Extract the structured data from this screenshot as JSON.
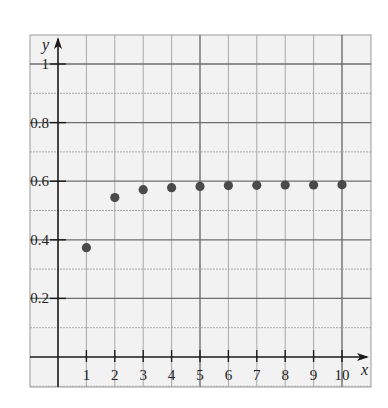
{
  "chart_data": {
    "type": "scatter",
    "title": "",
    "xlabel": "x",
    "ylabel": "y",
    "x": [
      1,
      2,
      3,
      4,
      5,
      6,
      7,
      8,
      9,
      10
    ],
    "series": [
      {
        "name": "sequence",
        "values": [
          0.373,
          0.544,
          0.571,
          0.578,
          0.582,
          0.585,
          0.586,
          0.587,
          0.587,
          0.588
        ]
      }
    ],
    "xlim": [
      -1,
      11
    ],
    "ylim": [
      -0.1,
      1.1
    ],
    "x_ticks": [
      "1",
      "2",
      "3",
      "4",
      "5",
      "6",
      "7",
      "8",
      "9",
      "10"
    ],
    "y_ticks": [
      "0.2",
      "0.4",
      "0.6",
      "0.8",
      "1"
    ],
    "grid": true,
    "legend": "none",
    "colors": {
      "background": "#f2f2f2",
      "grid_minor": "#a8a8a8",
      "grid_major": "#6e6e6e",
      "axis": "#1a1a1a",
      "point": "#4a4a4a"
    }
  }
}
